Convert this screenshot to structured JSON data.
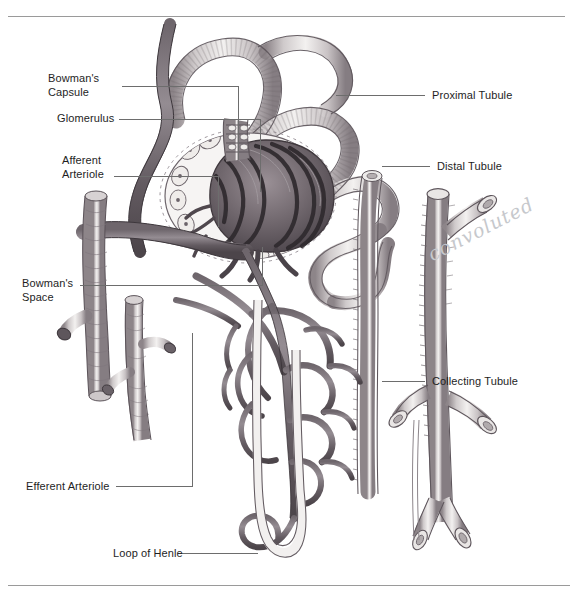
{
  "figure": {
    "style": "grayscale pen-and-ink medical illustration",
    "frame": {
      "top_rule": true,
      "bottom_rule": true,
      "rule_color": "#9a9a9a"
    }
  },
  "labels_left": [
    {
      "id": "bowmans-capsule",
      "text": "Bowman's\nCapsule",
      "x": 48,
      "y": 72
    },
    {
      "id": "glomerulus",
      "text": "Glomerulus",
      "x": 57,
      "y": 119
    },
    {
      "id": "afferent-arteriole",
      "text": "Afferent\nArteriole",
      "x": 62,
      "y": 154
    },
    {
      "id": "bowmans-space",
      "text": "Bowman's\nSpace",
      "x": 22,
      "y": 277
    },
    {
      "id": "efferent-arteriole",
      "text": "Efferent Arteriole",
      "x": 26,
      "y": 483
    },
    {
      "id": "loop-of-henle",
      "text": "Loop of Henle",
      "x": 113,
      "y": 550
    }
  ],
  "labels_right": [
    {
      "id": "proximal-tubule",
      "text": "Proximal Tubule",
      "x": 432,
      "y": 94
    },
    {
      "id": "distal-tubule",
      "text": "Distal Tubule",
      "x": 437,
      "y": 161
    },
    {
      "id": "collecting-tubule",
      "text": "Collecting Tubule",
      "x": 432,
      "y": 378
    }
  ],
  "annotation": {
    "id": "handwritten-note",
    "text": "convoluted",
    "x": 434,
    "y": 243,
    "color": "#c6c8cc",
    "rotation_deg": -27
  },
  "leader_lines": [
    {
      "id": "leader-bowmans-capsule",
      "points": "122,86 238,86 238,160"
    },
    {
      "id": "leader-glomerulus",
      "points": "119,119 260,119 260,192"
    },
    {
      "id": "leader-afferent-arteriole",
      "points": "114,176 218,176 218,227"
    },
    {
      "id": "leader-bowmans-space",
      "points": "80,285 262,285 262,247"
    },
    {
      "id": "leader-efferent-arteriole",
      "points": "116,486 192,486 192,333"
    },
    {
      "id": "leader-loop-of-henle",
      "points": "178,553 258,553"
    },
    {
      "id": "leader-proximal-tubule",
      "points": "336,95 425,95"
    },
    {
      "id": "leader-distal-tubule",
      "points": "382,166 430,166"
    },
    {
      "id": "leader-collecting-tubule",
      "points": "382,381 425,381"
    }
  ],
  "colors": {
    "ink_dark": "#4a4348",
    "ink_mid": "#7d757b",
    "ink_light": "#b9b3b6",
    "tubule_fill": "#f4f2f1",
    "leader": "#6d6d6d",
    "text": "#1e1e1e",
    "background": "#ffffff"
  }
}
